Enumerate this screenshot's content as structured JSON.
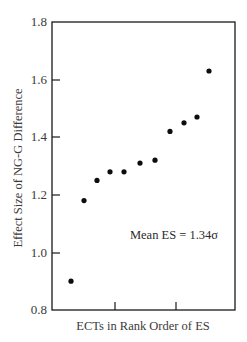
{
  "chart_data": {
    "type": "scatter",
    "title": "",
    "xlabel": "ECTs in Rank Order of ES",
    "ylabel": "Effect Size of NG-G Difference",
    "ylim": [
      0.8,
      1.8
    ],
    "yticks": [
      0.8,
      1.0,
      1.2,
      1.4,
      1.6,
      1.8
    ],
    "ytick_labels": [
      "0.8",
      "1.0",
      "1.2",
      "1.4",
      "1.6",
      "1.8"
    ],
    "xticks_unlabeled": 2,
    "grid": false,
    "legend": null,
    "annotation": "Mean ES = 1.34σ",
    "x": [
      1,
      2,
      3,
      4,
      5,
      6,
      7,
      8,
      9,
      10,
      11
    ],
    "values": [
      0.9,
      1.18,
      1.25,
      1.28,
      1.28,
      1.31,
      1.32,
      1.42,
      1.45,
      1.47,
      1.63
    ]
  },
  "labels": {
    "xlabel": "ECTs in Rank Order of ES",
    "ylabel": "Effect Size of NG-G Difference",
    "annotation": "Mean ES = 1.34σ",
    "yticks": [
      "0.8",
      "1.0",
      "1.2",
      "1.4",
      "1.6",
      "1.8"
    ]
  },
  "colors": {
    "axis": "#1a1a1a",
    "marker": "#0d0d0d",
    "text": "#3a3a3a"
  }
}
